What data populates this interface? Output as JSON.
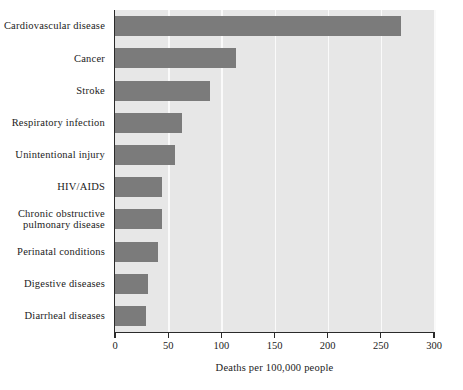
{
  "chart_data": {
    "type": "bar",
    "orientation": "horizontal",
    "title": "",
    "xlabel": "Deaths per 100,000 people",
    "ylabel": "",
    "xlim": [
      0,
      300
    ],
    "xticks": [
      0,
      50,
      100,
      150,
      200,
      250,
      300
    ],
    "xtick_labels": [
      "0",
      "50",
      "100",
      "150",
      "200",
      "250",
      "300"
    ],
    "grid": "vertical-white-gridlines",
    "legend": "none",
    "plot_background": "#e7e7e7",
    "bar_color": "#7b7b7b",
    "categories": [
      "Cardiovascular disease",
      "Cancer",
      "Stroke",
      "Respiratory infection",
      "Unintentional injury",
      "HIV/AIDS",
      "Chronic obstructive\npulmonary disease",
      "Perinatal conditions",
      "Digestive diseases",
      "Diarrheal diseases"
    ],
    "values": [
      269,
      114,
      89,
      63,
      56,
      44,
      44,
      40,
      31,
      29
    ]
  }
}
